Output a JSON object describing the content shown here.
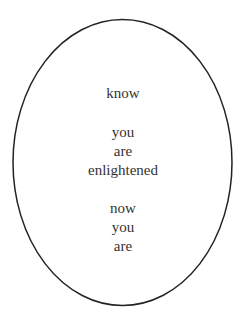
{
  "poem": {
    "lines": [
      {
        "text": "know",
        "y": 84
      },
      {
        "text": "you",
        "y": 123
      },
      {
        "text": "are",
        "y": 142
      },
      {
        "text": "enlightened",
        "y": 161
      },
      {
        "text": "now",
        "y": 199
      },
      {
        "text": "you",
        "y": 218
      },
      {
        "text": "are",
        "y": 237
      }
    ]
  },
  "colors": {
    "stroke": "#222222",
    "text": "#333333",
    "background": "#ffffff"
  }
}
